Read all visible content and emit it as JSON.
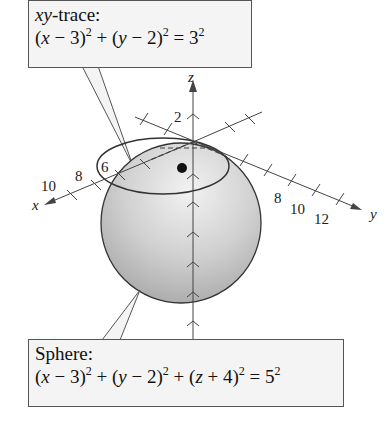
{
  "figure": {
    "type": "3d-sphere-diagram",
    "axes": {
      "x": {
        "label": "x",
        "tick_labels": [
          "6",
          "8",
          "10"
        ]
      },
      "y": {
        "label": "y",
        "tick_labels": [
          "8",
          "10",
          "12"
        ]
      },
      "z": {
        "label": "z",
        "tick_labels": [
          "2"
        ]
      }
    },
    "sphere": {
      "center": [
        3,
        2,
        -4
      ],
      "radius": 5
    },
    "trace": {
      "plane": "xy",
      "center": [
        3,
        2,
        0
      ],
      "radius": 3
    },
    "colors": {
      "sphere_fill": "#c8c8c8",
      "stroke": "#333333",
      "callout_bg": "#f4f4f4"
    }
  },
  "callouts": {
    "trace": {
      "title_var": "xy",
      "title_rest": "-trace:",
      "eq": {
        "p1": "(",
        "v1": "x",
        "p2": " − 3)",
        "s1": "2",
        "p3": " + (",
        "v2": "y",
        "p4": " − 2)",
        "s2": "2",
        "p5": " = 3",
        "s3": "2"
      }
    },
    "sphere": {
      "title": "Sphere:",
      "eq": {
        "p1": "(",
        "v1": "x",
        "p2": " − 3)",
        "s1": "2",
        "p3": " + (",
        "v2": "y",
        "p4": " − 2)",
        "s2": "2",
        "p5": " + (",
        "v3": "z",
        "p6": " + 4)",
        "s3": "2",
        "p7": " = 5",
        "s4": "2"
      }
    }
  }
}
